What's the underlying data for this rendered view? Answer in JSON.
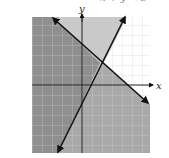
{
  "caption_partial": "x + y < 3",
  "axes": {
    "x_label": "x",
    "y_label": "y"
  },
  "colors": {
    "dark_region": "#8c8c8c",
    "medium_region": "#a6a6a6",
    "light_region": "#c8c8c8",
    "background": "#ffffff",
    "grid": "#d0d0d0",
    "line": "#111111"
  },
  "graph": {
    "type": "system-of-linear-inequalities",
    "grid_step_px": 10,
    "lines": [
      {
        "name": "falling-boundary",
        "from": [
          53,
          18
        ],
        "to": [
          148,
          103
        ],
        "arrows": "both"
      },
      {
        "name": "rising-boundary",
        "from": [
          58,
          152
        ],
        "to": [
          125,
          17
        ],
        "arrows": "both"
      }
    ]
  }
}
